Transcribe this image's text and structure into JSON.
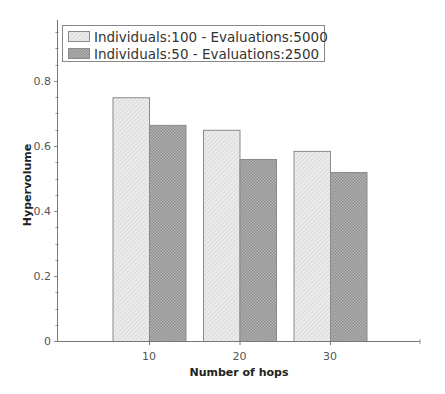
{
  "chart_data": {
    "type": "bar",
    "title": "",
    "xlabel": "Number of hops",
    "ylabel": "Hypervolume",
    "categories": [
      "10",
      "20",
      "30"
    ],
    "series": [
      {
        "name": "Individuals:100 - Evaluations:5000",
        "values": [
          0.75,
          0.65,
          0.585
        ],
        "fill": "#e6e6e6",
        "pattern": "diagonal-hatch"
      },
      {
        "name": "Individuals:50 - Evaluations:2500",
        "values": [
          0.665,
          0.56,
          0.52
        ],
        "fill": "#a9a9a9",
        "pattern": "crosshatch"
      }
    ],
    "ylim": [
      0,
      0.98
    ],
    "yticks": [
      0,
      0.2,
      0.4,
      0.6,
      0.8
    ],
    "ytick_labels": [
      "0",
      "0.2",
      "0.4",
      "0.6",
      "0.8"
    ],
    "minor_ytick_step": 0.05,
    "grid": false,
    "legend_position": "top-left inside"
  },
  "axes": {
    "y_origin_px": 341,
    "px_per_unit": 325,
    "x_axis_left": 57,
    "x_axis_right": 420,
    "y_axis_top": 20,
    "bar_width": 36.5,
    "group_centers": [
      149,
      239.5,
      330
    ]
  },
  "legend": {
    "items": [
      {
        "label": "Individuals:100 - Evaluations:5000"
      },
      {
        "label": "Individuals:50 - Evaluations:2500"
      }
    ]
  },
  "colors": {
    "axis": "#777777",
    "bar_border": "#8a8a8a",
    "legend_border": "#888888"
  }
}
